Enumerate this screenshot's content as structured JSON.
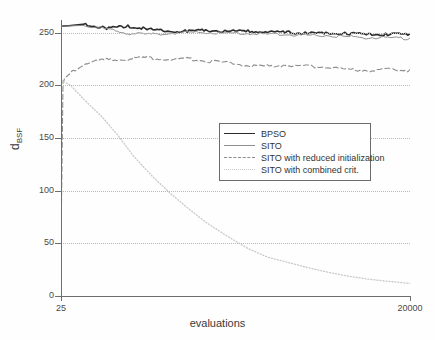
{
  "chart_data": {
    "type": "line",
    "title": "",
    "xlabel": "evaluations",
    "ylabel": "d_BSF",
    "ylabel_base": "d",
    "ylabel_sub": "BSF",
    "xlim": [
      25,
      20000
    ],
    "ylim": [
      0,
      262
    ],
    "x_scale": "log",
    "grid": true,
    "grid_style": "dotted",
    "legend_position": "center-right",
    "yticks": [
      0,
      50,
      100,
      150,
      200,
      250
    ],
    "ytick_labels": [
      "0",
      "50",
      "100",
      "150",
      "200",
      "250"
    ],
    "xticks": [
      25,
      20000
    ],
    "xtick_labels": [
      "25",
      "20000"
    ],
    "series": [
      {
        "name": "BPSO",
        "style": "solid-thick",
        "color": "#2b2b2b",
        "x": [
          25,
          40,
          60,
          90,
          130,
          190,
          280,
          400,
          600,
          900,
          1300,
          1900,
          2800,
          4000,
          6000,
          9000,
          13000,
          20000
        ],
        "y": [
          256,
          258,
          255,
          257,
          254,
          252,
          252,
          253,
          252,
          252,
          251,
          251,
          250,
          250,
          250,
          249,
          249,
          249
        ]
      },
      {
        "name": "SITO",
        "style": "solid-thin",
        "color": "#8e8e8e",
        "x": [
          25,
          40,
          60,
          90,
          130,
          190,
          280,
          400,
          600,
          900,
          1300,
          1900,
          2800,
          4000,
          6000,
          9000,
          13000,
          20000
        ],
        "y": [
          256,
          257,
          254,
          250,
          249,
          250,
          251,
          251,
          250,
          250,
          249,
          249,
          248,
          248,
          247,
          246,
          246,
          245
        ]
      },
      {
        "name": "SITO with reduced initialization",
        "style": "dashed",
        "color": "#8c8c8c",
        "x": [
          25,
          26,
          30,
          40,
          60,
          90,
          130,
          190,
          280,
          400,
          600,
          900,
          1300,
          1900,
          2800,
          4000,
          6000,
          9000,
          13000,
          20000
        ],
        "y": [
          50,
          205,
          212,
          222,
          225,
          226,
          227,
          225,
          226,
          224,
          222,
          220,
          219,
          220,
          219,
          218,
          216,
          215,
          216,
          215
        ]
      },
      {
        "name": "SITO with combined crit.",
        "style": "dotted",
        "color": "#c9c9c9",
        "x": [
          25,
          30,
          40,
          55,
          75,
          100,
          140,
          200,
          280,
          400,
          600,
          900,
          1300,
          1900,
          2800,
          4000,
          6000,
          9000,
          13000,
          20000
        ],
        "y": [
          205,
          200,
          185,
          170,
          152,
          133,
          115,
          98,
          84,
          70,
          57,
          45,
          37,
          32,
          27,
          23,
          19,
          16,
          14,
          12
        ]
      }
    ]
  },
  "legend": {
    "entries": [
      {
        "label": "BPSO"
      },
      {
        "label": "SITO"
      },
      {
        "label": "SITO with reduced initialization"
      },
      {
        "label": "SITO with combined crit."
      }
    ]
  }
}
